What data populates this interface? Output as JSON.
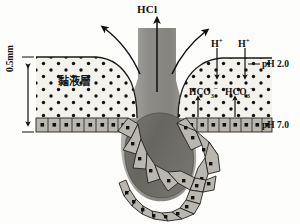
{
  "figure": {
    "title_label": "HCl",
    "mucus_layer_label": "黏液層",
    "thickness_label": "0.5mm",
    "ph_lumen_label": "pH 2.0",
    "ph_epithelium_label": "pH 7.0",
    "proton_labels": [
      "H",
      "H"
    ],
    "proton_charge": "+",
    "bicarbonate_labels": [
      "HCO",
      "HCO"
    ],
    "bicarbonate_sub": "3",
    "bicarbonate_charge": "−",
    "colors": {
      "mucus_fill": "#f2f1ec",
      "mucus_dot": "#111111",
      "epithelium_fill": "#b9b7b0",
      "epithelium_stroke": "#2b2b2b",
      "lumen_fill": "#6f6e6b",
      "pit_fill": "#8f8e8a",
      "outline": "#1a1a1a",
      "background": "#fdfdfb"
    },
    "elements": {
      "hcl_arrow": "upward-arrow",
      "curved_arrow_left": "curved-arrow-left",
      "curved_arrow_right": "curved-arrow-right",
      "proton_arrows": "downward-arrows",
      "bicarbonate_arrows": "upward-arrows",
      "thickness_arrow": "double-headed-vertical-arrow"
    }
  }
}
